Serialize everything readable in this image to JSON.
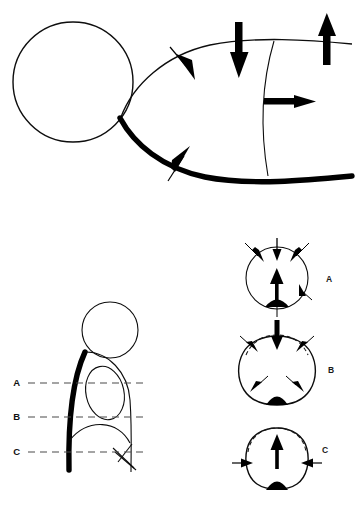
{
  "figure": {
    "background_color": "#ffffff",
    "ink_color": "#000000",
    "dash_color": "#4a4a4a",
    "width": 360,
    "height": 520
  },
  "panels": {
    "top": {
      "name": "sagittal-force-panel",
      "description": "Lateral view with circular body, curved surface outlines and applied force vectors",
      "arrows": [
        {
          "id": "top-oblique-down",
          "label": "",
          "direction": "down-right",
          "style": "solid-head",
          "x": 182,
          "y": 62
        },
        {
          "id": "top-vertical-down",
          "label": "",
          "direction": "down",
          "style": "heavy-shaft",
          "x": 239,
          "y": 50
        },
        {
          "id": "top-vertical-up",
          "label": "",
          "direction": "up",
          "style": "heavy-shaft",
          "x": 327,
          "y": 45
        },
        {
          "id": "mid-horizontal-right",
          "label": "",
          "direction": "right",
          "style": "heavy-shaft",
          "x": 285,
          "y": 100
        },
        {
          "id": "bottom-oblique-up",
          "label": "",
          "direction": "up-right",
          "style": "solid-head",
          "x": 180,
          "y": 163
        }
      ]
    },
    "bottom_left": {
      "name": "section-levels-panel",
      "description": "Profile view marked with three transverse section levels",
      "levels": [
        {
          "label": "A",
          "y": 383
        },
        {
          "label": "B",
          "y": 417
        },
        {
          "label": "C",
          "y": 452
        }
      ],
      "dash_start_x": 28,
      "dash_end_x": 147,
      "label_x": 20
    },
    "bottom_right": {
      "name": "cross-section-panel",
      "description": "Three transverse cross sections showing deformation and force vectors at levels A, B and C",
      "sections": [
        {
          "label": "A",
          "label_x": 326,
          "label_y": 280,
          "center_x": 277,
          "center_y": 278,
          "radius": 31,
          "deformed": false,
          "arrow_count": 6,
          "description": "Undeformed round section with inward radial forces and a central upward vector"
        },
        {
          "label": "B",
          "label_x": 328,
          "label_y": 371,
          "center_x": 277,
          "center_y": 368,
          "radius": 33,
          "deformed": true,
          "arrow_count": 6,
          "description": "Flattened superior pole with dashed original outline and converging forces"
        },
        {
          "label": "C",
          "label_x": 322,
          "label_y": 463,
          "center_x": 277,
          "center_y": 458,
          "radius": 31,
          "deformed": true,
          "arrow_count": 4,
          "description": "Laterally compressed section with dashed original outline and medial forces"
        }
      ]
    }
  }
}
